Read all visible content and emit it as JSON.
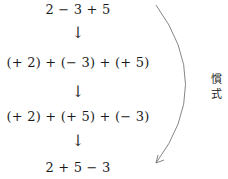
{
  "steps": [
    {
      "expression": "2 − 3 + 5"
    },
    {
      "expression": "(+ 2) + (− 3) + (+ 5)"
    },
    {
      "expression": "(+ 2) + (+ 5) + (− 3)"
    },
    {
      "expression": "2 + 5 − 3"
    }
  ],
  "arrows": {
    "down_glyph": "↓"
  },
  "side_note": {
    "line1": "慣",
    "line2": "式"
  },
  "colors": {
    "text": "#1a1a1a",
    "curve": "#777777"
  }
}
